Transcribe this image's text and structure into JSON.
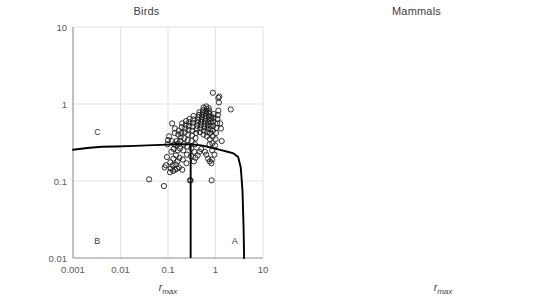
{
  "figure": {
    "y_axis_label_line1": "Variability in growth rate due to",
    "y_axis_label_line2": "environmental stochasticity",
    "x_axis_label_main": "r",
    "x_axis_label_sub": "max"
  },
  "panels": [
    {
      "title": "Birds",
      "region_a": "A",
      "region_b": "B",
      "region_c": "C"
    },
    {
      "title": "Mammals",
      "region_a": "A",
      "region_b": "B",
      "region_c": "C"
    }
  ],
  "ticks": {
    "x": [
      "0.001",
      "0.01",
      "0.1",
      "1",
      "10"
    ],
    "y": [
      "10",
      "1",
      "0.1",
      "0.01"
    ]
  },
  "chart_data": [
    {
      "type": "scatter",
      "title": "Birds",
      "xlabel": "r_max",
      "ylabel": "Variability in growth rate due to environmental stochasticity",
      "xscale": "log",
      "yscale": "log",
      "xlim": [
        0.001,
        10
      ],
      "ylim": [
        0.01,
        10
      ],
      "grid": true,
      "legend": "none",
      "marker": "open-circle",
      "annotations": [
        {
          "text": "A",
          "x": 2.2,
          "y": 0.016
        },
        {
          "text": "B",
          "x": 0.0028,
          "y": 0.016
        },
        {
          "text": "C",
          "x": 0.0028,
          "y": 0.42
        }
      ],
      "threshold_vertical_line": {
        "x": 0.3,
        "y_from": 0.01,
        "y_to": 0.3
      },
      "threshold_curve": {
        "x": [
          0.001,
          0.002,
          0.004,
          0.008,
          0.02,
          0.05,
          0.1,
          0.2,
          0.3,
          0.5,
          0.8,
          1.2,
          1.8,
          2.4,
          3.0,
          3.4,
          3.7,
          3.9,
          4.0
        ],
        "y": [
          0.255,
          0.268,
          0.278,
          0.281,
          0.286,
          0.292,
          0.297,
          0.3,
          0.3,
          0.29,
          0.272,
          0.255,
          0.24,
          0.228,
          0.205,
          0.15,
          0.075,
          0.025,
          0.01
        ]
      },
      "points": [
        {
          "x": 0.04,
          "y": 0.105
        },
        {
          "x": 0.082,
          "y": 0.086
        },
        {
          "x": 0.085,
          "y": 0.15
        },
        {
          "x": 0.09,
          "y": 0.16
        },
        {
          "x": 0.095,
          "y": 0.205
        },
        {
          "x": 0.098,
          "y": 0.3
        },
        {
          "x": 0.1,
          "y": 0.34
        },
        {
          "x": 0.105,
          "y": 0.38
        },
        {
          "x": 0.11,
          "y": 0.13
        },
        {
          "x": 0.112,
          "y": 0.175
        },
        {
          "x": 0.115,
          "y": 0.145
        },
        {
          "x": 0.118,
          "y": 0.24
        },
        {
          "x": 0.12,
          "y": 0.33
        },
        {
          "x": 0.122,
          "y": 0.56
        },
        {
          "x": 0.125,
          "y": 0.16
        },
        {
          "x": 0.128,
          "y": 0.135
        },
        {
          "x": 0.13,
          "y": 0.195
        },
        {
          "x": 0.132,
          "y": 0.26
        },
        {
          "x": 0.135,
          "y": 0.3
        },
        {
          "x": 0.138,
          "y": 0.42
        },
        {
          "x": 0.14,
          "y": 0.48
        },
        {
          "x": 0.142,
          "y": 0.14
        },
        {
          "x": 0.145,
          "y": 0.165
        },
        {
          "x": 0.148,
          "y": 0.215
        },
        {
          "x": 0.15,
          "y": 0.29
        },
        {
          "x": 0.152,
          "y": 0.33
        },
        {
          "x": 0.155,
          "y": 0.145
        },
        {
          "x": 0.158,
          "y": 0.18
        },
        {
          "x": 0.16,
          "y": 0.25
        },
        {
          "x": 0.163,
          "y": 0.305
        },
        {
          "x": 0.165,
          "y": 0.4
        },
        {
          "x": 0.168,
          "y": 0.45
        },
        {
          "x": 0.17,
          "y": 0.15
        },
        {
          "x": 0.175,
          "y": 0.2
        },
        {
          "x": 0.178,
          "y": 0.265
        },
        {
          "x": 0.18,
          "y": 0.33
        },
        {
          "x": 0.185,
          "y": 0.37
        },
        {
          "x": 0.19,
          "y": 0.42
        },
        {
          "x": 0.195,
          "y": 0.5
        },
        {
          "x": 0.198,
          "y": 0.56
        },
        {
          "x": 0.2,
          "y": 0.14
        },
        {
          "x": 0.205,
          "y": 0.19
        },
        {
          "x": 0.21,
          "y": 0.25
        },
        {
          "x": 0.215,
          "y": 0.3
        },
        {
          "x": 0.22,
          "y": 0.36
        },
        {
          "x": 0.225,
          "y": 0.43
        },
        {
          "x": 0.23,
          "y": 0.48
        },
        {
          "x": 0.235,
          "y": 0.54
        },
        {
          "x": 0.24,
          "y": 0.6
        },
        {
          "x": 0.245,
          "y": 0.17
        },
        {
          "x": 0.25,
          "y": 0.22
        },
        {
          "x": 0.255,
          "y": 0.28
        },
        {
          "x": 0.26,
          "y": 0.34
        },
        {
          "x": 0.265,
          "y": 0.4
        },
        {
          "x": 0.27,
          "y": 0.46
        },
        {
          "x": 0.275,
          "y": 0.52
        },
        {
          "x": 0.28,
          "y": 0.58
        },
        {
          "x": 0.285,
          "y": 0.64
        },
        {
          "x": 0.29,
          "y": 0.102
        },
        {
          "x": 0.3,
          "y": 0.102
        },
        {
          "x": 0.305,
          "y": 0.21
        },
        {
          "x": 0.31,
          "y": 0.265
        },
        {
          "x": 0.315,
          "y": 0.33
        },
        {
          "x": 0.32,
          "y": 0.39
        },
        {
          "x": 0.325,
          "y": 0.45
        },
        {
          "x": 0.33,
          "y": 0.51
        },
        {
          "x": 0.335,
          "y": 0.57
        },
        {
          "x": 0.34,
          "y": 0.63
        },
        {
          "x": 0.345,
          "y": 0.7
        },
        {
          "x": 0.35,
          "y": 0.18
        },
        {
          "x": 0.36,
          "y": 0.24
        },
        {
          "x": 0.37,
          "y": 0.3
        },
        {
          "x": 0.38,
          "y": 0.36
        },
        {
          "x": 0.39,
          "y": 0.42
        },
        {
          "x": 0.4,
          "y": 0.47
        },
        {
          "x": 0.41,
          "y": 0.52
        },
        {
          "x": 0.42,
          "y": 0.57
        },
        {
          "x": 0.43,
          "y": 0.62
        },
        {
          "x": 0.44,
          "y": 0.67
        },
        {
          "x": 0.45,
          "y": 0.72
        },
        {
          "x": 0.46,
          "y": 0.78
        },
        {
          "x": 0.47,
          "y": 0.43
        },
        {
          "x": 0.48,
          "y": 0.48
        },
        {
          "x": 0.49,
          "y": 0.53
        },
        {
          "x": 0.5,
          "y": 0.58
        },
        {
          "x": 0.51,
          "y": 0.63
        },
        {
          "x": 0.52,
          "y": 0.68
        },
        {
          "x": 0.53,
          "y": 0.73
        },
        {
          "x": 0.54,
          "y": 0.78
        },
        {
          "x": 0.55,
          "y": 0.83
        },
        {
          "x": 0.56,
          "y": 0.4
        },
        {
          "x": 0.57,
          "y": 0.45
        },
        {
          "x": 0.58,
          "y": 0.5
        },
        {
          "x": 0.59,
          "y": 0.55
        },
        {
          "x": 0.6,
          "y": 0.6
        },
        {
          "x": 0.61,
          "y": 0.65
        },
        {
          "x": 0.62,
          "y": 0.7
        },
        {
          "x": 0.63,
          "y": 0.75
        },
        {
          "x": 0.64,
          "y": 0.8
        },
        {
          "x": 0.65,
          "y": 0.86
        },
        {
          "x": 0.66,
          "y": 0.38
        },
        {
          "x": 0.67,
          "y": 0.43
        },
        {
          "x": 0.68,
          "y": 0.48
        },
        {
          "x": 0.69,
          "y": 0.53
        },
        {
          "x": 0.7,
          "y": 0.58
        },
        {
          "x": 0.71,
          "y": 0.63
        },
        {
          "x": 0.72,
          "y": 0.69
        },
        {
          "x": 0.73,
          "y": 0.75
        },
        {
          "x": 0.74,
          "y": 0.81
        },
        {
          "x": 0.75,
          "y": 0.3
        },
        {
          "x": 0.76,
          "y": 0.35
        },
        {
          "x": 0.77,
          "y": 0.42
        },
        {
          "x": 0.78,
          "y": 0.47
        },
        {
          "x": 0.79,
          "y": 0.52
        },
        {
          "x": 0.8,
          "y": 0.57
        },
        {
          "x": 0.81,
          "y": 0.63
        },
        {
          "x": 0.82,
          "y": 0.69
        },
        {
          "x": 0.83,
          "y": 0.102
        },
        {
          "x": 0.84,
          "y": 0.19
        },
        {
          "x": 0.85,
          "y": 0.25
        },
        {
          "x": 0.86,
          "y": 0.31
        },
        {
          "x": 0.87,
          "y": 0.38
        },
        {
          "x": 0.88,
          "y": 0.45
        },
        {
          "x": 0.89,
          "y": 0.52
        },
        {
          "x": 0.9,
          "y": 0.59
        },
        {
          "x": 0.91,
          "y": 0.66
        },
        {
          "x": 0.92,
          "y": 0.74
        },
        {
          "x": 0.95,
          "y": 0.22
        },
        {
          "x": 0.98,
          "y": 0.29
        },
        {
          "x": 1.0,
          "y": 0.35
        },
        {
          "x": 1.02,
          "y": 0.42
        },
        {
          "x": 1.05,
          "y": 0.49
        },
        {
          "x": 1.08,
          "y": 0.56
        },
        {
          "x": 1.1,
          "y": 0.64
        },
        {
          "x": 1.12,
          "y": 0.72
        },
        {
          "x": 1.15,
          "y": 0.82
        },
        {
          "x": 1.18,
          "y": 1.05
        },
        {
          "x": 1.2,
          "y": 1.25
        },
        {
          "x": 0.88,
          "y": 1.4
        },
        {
          "x": 1.15,
          "y": 1.2
        },
        {
          "x": 1.25,
          "y": 0.56
        },
        {
          "x": 1.3,
          "y": 0.48
        },
        {
          "x": 1.35,
          "y": 0.33
        },
        {
          "x": 2.1,
          "y": 0.85
        },
        {
          "x": 0.64,
          "y": 0.93
        },
        {
          "x": 0.72,
          "y": 0.88
        },
        {
          "x": 0.56,
          "y": 0.9
        },
        {
          "x": 0.6,
          "y": 0.24
        },
        {
          "x": 0.64,
          "y": 0.22
        },
        {
          "x": 0.7,
          "y": 0.195
        },
        {
          "x": 0.76,
          "y": 0.18
        },
        {
          "x": 0.82,
          "y": 0.17
        },
        {
          "x": 0.5,
          "y": 0.26
        },
        {
          "x": 0.46,
          "y": 0.24
        },
        {
          "x": 0.42,
          "y": 0.215
        },
        {
          "x": 0.38,
          "y": 0.2
        }
      ]
    },
    {
      "type": "scatter",
      "title": "Mammals",
      "xlabel": "r_max",
      "ylabel": "Variability in growth rate due to environmental stochasticity",
      "xscale": "log",
      "yscale": "log",
      "xlim": [
        0.001,
        10
      ],
      "ylim": [
        0.01,
        10
      ],
      "grid": true,
      "legend": "none",
      "marker": "open-circle",
      "annotations": [
        {
          "text": "A",
          "x": 2.2,
          "y": 0.016
        },
        {
          "text": "B",
          "x": 0.0028,
          "y": 0.016
        },
        {
          "text": "C",
          "x": 0.0028,
          "y": 0.42
        }
      ],
      "threshold_vertical_line": {
        "x": 0.3,
        "y_from": 0.01,
        "y_to": 0.3
      },
      "threshold_curve": {
        "x": [
          0.001,
          0.002,
          0.004,
          0.008,
          0.02,
          0.05,
          0.1,
          0.2,
          0.3,
          0.5,
          0.8,
          1.2,
          1.8,
          2.4,
          3.0,
          3.4,
          3.7,
          3.9,
          4.0
        ],
        "y": [
          0.255,
          0.268,
          0.278,
          0.281,
          0.286,
          0.292,
          0.297,
          0.3,
          0.3,
          0.29,
          0.272,
          0.255,
          0.24,
          0.228,
          0.205,
          0.15,
          0.075,
          0.025,
          0.01
        ]
      },
      "points": [
        {
          "x": 0.013,
          "y": 0.026
        },
        {
          "x": 0.22,
          "y": 0.023
        },
        {
          "x": 0.08,
          "y": 1.08
        },
        {
          "x": 0.082,
          "y": 0.42
        },
        {
          "x": 0.12,
          "y": 0.32
        },
        {
          "x": 0.13,
          "y": 0.24
        },
        {
          "x": 0.135,
          "y": 0.185
        },
        {
          "x": 0.14,
          "y": 0.16
        },
        {
          "x": 0.145,
          "y": 0.14
        },
        {
          "x": 0.15,
          "y": 0.096
        },
        {
          "x": 0.155,
          "y": 0.3
        },
        {
          "x": 0.16,
          "y": 0.38
        },
        {
          "x": 0.165,
          "y": 0.52
        },
        {
          "x": 0.17,
          "y": 0.64
        },
        {
          "x": 0.175,
          "y": 0.7
        },
        {
          "x": 0.18,
          "y": 0.78
        },
        {
          "x": 0.185,
          "y": 0.84
        },
        {
          "x": 0.19,
          "y": 0.9
        },
        {
          "x": 0.195,
          "y": 0.2
        },
        {
          "x": 0.2,
          "y": 0.165
        },
        {
          "x": 0.205,
          "y": 0.155
        },
        {
          "x": 0.21,
          "y": 0.33
        },
        {
          "x": 0.215,
          "y": 0.4
        },
        {
          "x": 0.22,
          "y": 0.47
        },
        {
          "x": 0.225,
          "y": 0.55
        },
        {
          "x": 0.23,
          "y": 0.62
        },
        {
          "x": 0.235,
          "y": 0.69
        },
        {
          "x": 0.24,
          "y": 0.76
        },
        {
          "x": 0.245,
          "y": 0.83
        },
        {
          "x": 0.25,
          "y": 0.9
        },
        {
          "x": 0.255,
          "y": 0.96
        },
        {
          "x": 0.26,
          "y": 0.3
        },
        {
          "x": 0.27,
          "y": 0.36
        },
        {
          "x": 0.28,
          "y": 0.43
        },
        {
          "x": 0.29,
          "y": 0.5
        },
        {
          "x": 0.3,
          "y": 0.57
        },
        {
          "x": 0.31,
          "y": 0.64
        },
        {
          "x": 0.32,
          "y": 0.71
        },
        {
          "x": 0.33,
          "y": 0.79
        },
        {
          "x": 0.34,
          "y": 0.86
        },
        {
          "x": 0.35,
          "y": 0.93
        },
        {
          "x": 0.36,
          "y": 1.0
        },
        {
          "x": 0.37,
          "y": 0.3
        },
        {
          "x": 0.38,
          "y": 0.37
        },
        {
          "x": 0.39,
          "y": 0.45
        },
        {
          "x": 0.4,
          "y": 0.52
        },
        {
          "x": 0.41,
          "y": 0.6
        },
        {
          "x": 0.42,
          "y": 0.68
        },
        {
          "x": 0.43,
          "y": 0.76
        },
        {
          "x": 0.44,
          "y": 0.84
        },
        {
          "x": 0.45,
          "y": 0.92
        },
        {
          "x": 0.46,
          "y": 1.0
        },
        {
          "x": 0.48,
          "y": 0.56
        },
        {
          "x": 0.5,
          "y": 0.64
        },
        {
          "x": 0.52,
          "y": 0.72
        },
        {
          "x": 0.54,
          "y": 0.8
        },
        {
          "x": 0.56,
          "y": 0.88
        },
        {
          "x": 0.58,
          "y": 0.96
        },
        {
          "x": 0.6,
          "y": 1.04
        },
        {
          "x": 0.62,
          "y": 1.12
        },
        {
          "x": 0.64,
          "y": 1.18
        },
        {
          "x": 0.66,
          "y": 1.24
        },
        {
          "x": 0.5,
          "y": 0.18
        },
        {
          "x": 0.56,
          "y": 0.17
        },
        {
          "x": 0.7,
          "y": 0.145
        },
        {
          "x": 0.68,
          "y": 0.62
        },
        {
          "x": 0.7,
          "y": 0.7
        },
        {
          "x": 0.72,
          "y": 0.78
        },
        {
          "x": 0.74,
          "y": 0.86
        },
        {
          "x": 0.76,
          "y": 0.94
        },
        {
          "x": 0.78,
          "y": 1.02
        },
        {
          "x": 0.8,
          "y": 1.1
        },
        {
          "x": 0.82,
          "y": 1.18
        },
        {
          "x": 0.85,
          "y": 0.52
        },
        {
          "x": 0.88,
          "y": 0.6
        },
        {
          "x": 0.9,
          "y": 0.68
        },
        {
          "x": 0.95,
          "y": 0.76
        },
        {
          "x": 1.0,
          "y": 0.84
        },
        {
          "x": 1.05,
          "y": 0.92
        },
        {
          "x": 1.1,
          "y": 1.0
        },
        {
          "x": 1.15,
          "y": 1.1
        },
        {
          "x": 1.2,
          "y": 1.2
        },
        {
          "x": 1.25,
          "y": 0.56
        },
        {
          "x": 1.3,
          "y": 0.48
        },
        {
          "x": 1.4,
          "y": 0.44
        },
        {
          "x": 1.5,
          "y": 0.7
        },
        {
          "x": 1.8,
          "y": 0.52
        },
        {
          "x": 2.0,
          "y": 1.05
        },
        {
          "x": 0.33,
          "y": 0.26
        },
        {
          "x": 0.35,
          "y": 0.29
        },
        {
          "x": 0.42,
          "y": 0.29
        },
        {
          "x": 0.26,
          "y": 0.15
        }
      ]
    }
  ]
}
